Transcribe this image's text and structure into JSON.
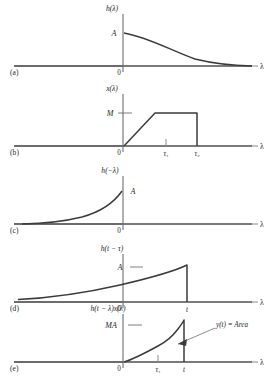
{
  "figure": {
    "axis_label_lambda": "λ",
    "origin_label": "0"
  },
  "colors": {
    "curve": "#3b3b3b",
    "axis": "#8a8a8a",
    "baseline": "#3b3b3b",
    "text": "#231f20",
    "background": "#ffffff"
  },
  "panels": [
    {
      "letter": "(a)",
      "function_label": "h(λ)",
      "amplitude_label": "A",
      "origin_label": "0",
      "axis_label": "λ",
      "ticks": [
        "0"
      ],
      "curve_type": "decaying-exponential",
      "description": "Impulse response h(lambda): starts at amplitude A at lambda = 0 and decays exponentially toward zero for positive lambda; zero for negative lambda."
    },
    {
      "letter": "(b)",
      "function_label": "x(λ)",
      "amplitude_label": "M",
      "origin_label": "0",
      "axis_label": "λ",
      "ticks": [
        "0",
        "τ₁",
        "τ₂"
      ],
      "tick_tau1": "τ₁",
      "tick_tau2": "τ₂",
      "curve_type": "trapezoidal-pulse",
      "description": "Input x(lambda): linear ramp from 0 up to level M, flat plateau at M, then abrupt drop to zero at tau-2."
    },
    {
      "letter": "(c)",
      "function_label": "h(−λ)",
      "amplitude_label": "A",
      "origin_label": "0",
      "axis_label": "λ",
      "ticks": [
        "0"
      ],
      "curve_type": "folded-exponential",
      "description": "Folded impulse response h(-lambda): rises exponentially from zero on the negative lambda axis to amplitude A at lambda = 0, then zero."
    },
    {
      "letter": "(d)",
      "function_label": "h(t − τ)",
      "amplitude_label": "A",
      "origin_label": "0",
      "axis_label": "λ",
      "ticks": [
        "0",
        "t"
      ],
      "tick_t": "t",
      "curve_type": "shifted-folded-exponential",
      "description": "Folded and shifted impulse response h(t - tau): rises exponentially to amplitude A at lambda = t, then drops abruptly to zero."
    },
    {
      "letter": "(e)",
      "function_label": "h(t − λ)x(λ)",
      "amplitude_label": "MA",
      "origin_label": "0",
      "axis_label": "λ",
      "ticks": [
        "0",
        "τ₁",
        "t"
      ],
      "tick_tau1": "τ₁",
      "tick_t": "t",
      "annotation": "y(t) = Area",
      "curve_type": "product-curve",
      "description": "Product h(t - lambda)x(lambda): rises from zero at 0, ramp-like segment to tau-1, then steeper exponential growth up to the drop at lambda = t. The shaded region under the curve is the convolution output."
    }
  ]
}
